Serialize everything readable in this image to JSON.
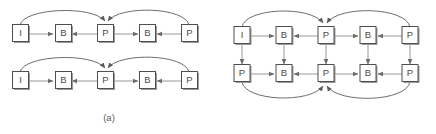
{
  "figure": {
    "type": "diagram",
    "colors": {
      "box_stroke": "#4f4f4f",
      "box_fill": "#ffffff",
      "box_shadow": "#9a9a9a",
      "arrow": "#6b6b6b",
      "arc": "#5c5c5c",
      "text": "#4a4a4a",
      "background": "#ffffff"
    },
    "panels": [
      {
        "id": "a",
        "caption": "(a)",
        "rows": [
          {
            "id": "a-row-1",
            "nodes": [
              {
                "id": "a1n1",
                "label": "I"
              },
              {
                "id": "a1n2",
                "label": "B"
              },
              {
                "id": "a1n3",
                "label": "P"
              },
              {
                "id": "a1n4",
                "label": "B"
              },
              {
                "id": "a1n5",
                "label": "P"
              }
            ]
          },
          {
            "id": "a-row-2",
            "nodes": [
              {
                "id": "a2n1",
                "label": "I"
              },
              {
                "id": "a2n2",
                "label": "B"
              },
              {
                "id": "a2n3",
                "label": "P"
              },
              {
                "id": "a2n4",
                "label": "B"
              },
              {
                "id": "a2n5",
                "label": "P"
              }
            ]
          }
        ]
      },
      {
        "id": "b",
        "caption": "(b)",
        "rows": [
          {
            "id": "b-row-1",
            "nodes": [
              {
                "id": "b1n1",
                "label": "I"
              },
              {
                "id": "b1n2",
                "label": "B"
              },
              {
                "id": "b1n3",
                "label": "P"
              },
              {
                "id": "b1n4",
                "label": "B"
              },
              {
                "id": "b1n5",
                "label": "P"
              }
            ]
          },
          {
            "id": "b-row-2",
            "nodes": [
              {
                "id": "b2n1",
                "label": "P"
              },
              {
                "id": "b2n2",
                "label": "B"
              },
              {
                "id": "b2n3",
                "label": "P"
              },
              {
                "id": "b2n4",
                "label": "B"
              },
              {
                "id": "b2n5",
                "label": "P"
              }
            ]
          }
        ]
      }
    ]
  }
}
